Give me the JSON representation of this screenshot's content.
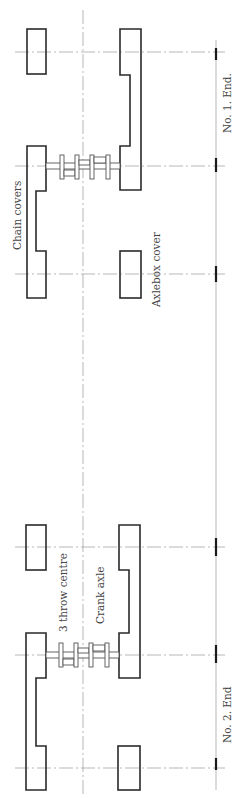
{
  "drawing": {
    "labels": {
      "no1_end": "No. 1. End.",
      "no2_end": "No. 2. End",
      "chain_covers": "Chain covers",
      "axlebox_cover": "Axlebox cover",
      "three_throw_centre": "3 throw centre",
      "crank_axle": "Crank axle"
    },
    "colors": {
      "outline": "#2a2a2a",
      "centre_line": "#9a9a9a",
      "background": "#ffffff"
    }
  }
}
